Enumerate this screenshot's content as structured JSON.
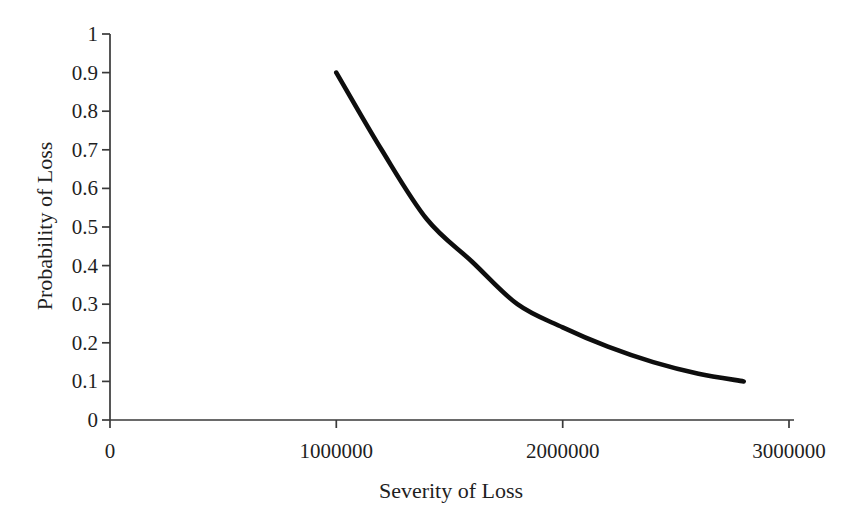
{
  "chart_data": {
    "type": "line",
    "title": "",
    "xlabel": "Severity of Loss",
    "ylabel": "Probability of Loss",
    "xlim": [
      0,
      3000000
    ],
    "ylim": [
      0,
      1
    ],
    "x_ticks": [
      0,
      1000000,
      2000000,
      3000000
    ],
    "x_tick_labels": [
      "0",
      "1000000",
      "2000000",
      "3000000"
    ],
    "y_ticks": [
      0,
      0.1,
      0.2,
      0.3,
      0.4,
      0.5,
      0.6,
      0.7,
      0.8,
      0.9,
      1
    ],
    "y_tick_labels": [
      "0",
      "0.1",
      "0.2",
      "0.3",
      "0.4",
      "0.5",
      "0.6",
      "0.7",
      "0.8",
      "0.9",
      "1"
    ],
    "grid": false,
    "legend_position": "none",
    "series": [
      {
        "name": "probability-vs-severity",
        "x": [
          1000000,
          1200000,
          1400000,
          1600000,
          1800000,
          2000000,
          2200000,
          2400000,
          2600000,
          2800000
        ],
        "y": [
          0.9,
          0.7,
          0.52,
          0.41,
          0.3,
          0.24,
          0.19,
          0.15,
          0.12,
          0.1
        ]
      }
    ],
    "colors": {
      "curve": "#0e0e0e",
      "axis": "#3a3a3a",
      "text": "#1f1f1f",
      "background": "#ffffff"
    }
  }
}
